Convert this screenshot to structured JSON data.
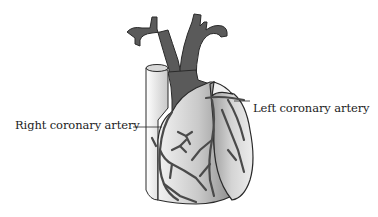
{
  "diagram": {
    "labels": {
      "right_coronary_artery": "Right coronary artery",
      "left_coronary_artery": "Left coronary artery"
    },
    "colors": {
      "background": "#ffffff",
      "vessel_dark": "#5a5a5a",
      "outline": "#2a2a2a",
      "heart_light": "#e6e6e6",
      "heart_mid": "#a8a8a8",
      "text": "#1c1c1c"
    }
  }
}
